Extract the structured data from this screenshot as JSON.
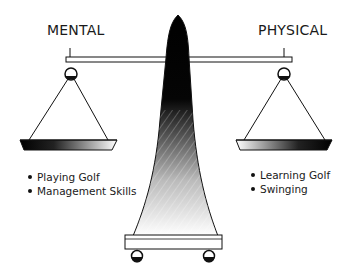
{
  "diagram": {
    "type": "balance-scale",
    "left": {
      "title": "MENTAL",
      "items": [
        "Playing Golf",
        "Management Skills"
      ]
    },
    "right": {
      "title": "PHYSICAL",
      "items": [
        "Learning Golf",
        "Swinging"
      ]
    },
    "colors": {
      "ink": "#111111",
      "background": "#ffffff"
    }
  }
}
